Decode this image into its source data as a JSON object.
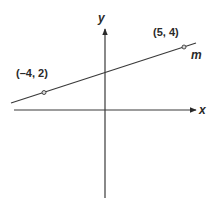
{
  "diagram": {
    "type": "coordinate-plane-line",
    "axes": {
      "x_label": "x",
      "y_label": "y"
    },
    "line": {
      "name": "m"
    },
    "points": [
      {
        "label": "(–4, 2)",
        "x": -4,
        "y": 2
      },
      {
        "label": "(5, 4)",
        "x": 5,
        "y": 4
      }
    ],
    "colors": {
      "stroke": "#3a3a3a",
      "point_fill": "#d8d8d8",
      "background": "#ffffff"
    }
  }
}
